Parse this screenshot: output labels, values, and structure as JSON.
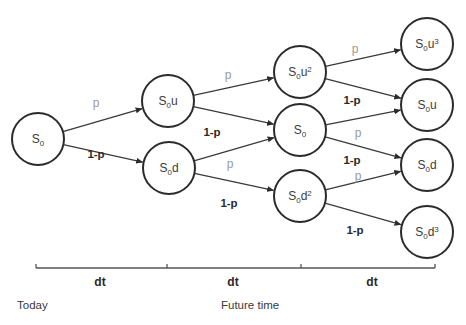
{
  "diagram": {
    "type": "binomial-tree",
    "colors": {
      "node_stroke": "#2b2b2b",
      "edge": "#3a3a3a",
      "up_prob_label": "#9a9a9a",
      "down_prob_label": "#2a2a2a"
    },
    "nodes": [
      {
        "id": "n0",
        "base": "S",
        "sub": "0",
        "suffix": "",
        "sup": "",
        "cx": 38,
        "cy": 139
      },
      {
        "id": "n1u",
        "base": "S",
        "sub": "0",
        "suffix": "u",
        "sup": "",
        "cx": 168,
        "cy": 101
      },
      {
        "id": "n1d",
        "base": "S",
        "sub": "0",
        "suffix": "d",
        "sup": "",
        "cx": 169,
        "cy": 168
      },
      {
        "id": "n2uu",
        "base": "S",
        "sub": "0",
        "suffix": "u",
        "sup": "2",
        "cx": 300,
        "cy": 72
      },
      {
        "id": "n2ud",
        "base": "S",
        "sub": "0",
        "suffix": "",
        "sup": "",
        "cx": 300,
        "cy": 130
      },
      {
        "id": "n2dd",
        "base": "S",
        "sub": "0",
        "suffix": "d",
        "sup": "2",
        "cx": 300,
        "cy": 196
      },
      {
        "id": "n3u3",
        "base": "S",
        "sub": "0",
        "suffix": "u",
        "sup": "3",
        "cx": 427,
        "cy": 44
      },
      {
        "id": "n3u",
        "base": "S",
        "sub": "0",
        "suffix": "u",
        "sup": "",
        "cx": 427,
        "cy": 105
      },
      {
        "id": "n3d",
        "base": "S",
        "sub": "0",
        "suffix": "d",
        "sup": "",
        "cx": 427,
        "cy": 165
      },
      {
        "id": "n3d3",
        "base": "S",
        "sub": "0",
        "suffix": "d",
        "sup": "3",
        "cx": 427,
        "cy": 232
      }
    ],
    "edges": [
      {
        "from": "n0",
        "to": "n1u",
        "label": "p",
        "kind": "up",
        "lx": 96,
        "ly": 107
      },
      {
        "from": "n0",
        "to": "n1d",
        "label": "1-p",
        "kind": "down",
        "lx": 96,
        "ly": 158
      },
      {
        "from": "n1u",
        "to": "n2uu",
        "label": "p",
        "kind": "up",
        "lx": 228,
        "ly": 79
      },
      {
        "from": "n1u",
        "to": "n2ud",
        "label": "1-p",
        "kind": "down",
        "lx": 212,
        "ly": 136
      },
      {
        "from": "n1d",
        "to": "n2ud",
        "label": "p",
        "kind": "up",
        "lx": 230,
        "ly": 168
      },
      {
        "from": "n1d",
        "to": "n2dd",
        "label": "1-p",
        "kind": "down",
        "lx": 229,
        "ly": 207
      },
      {
        "from": "n2uu",
        "to": "n3u3",
        "label": "p",
        "kind": "up",
        "lx": 355,
        "ly": 53
      },
      {
        "from": "n2uu",
        "to": "n3u",
        "label": "1-p",
        "kind": "down",
        "lx": 352,
        "ly": 104
      },
      {
        "from": "n2ud",
        "to": "n3u",
        "label": "p",
        "kind": "up",
        "lx": 358,
        "ly": 137
      },
      {
        "from": "n2ud",
        "to": "n3d",
        "label": "1-p",
        "kind": "down",
        "lx": 352,
        "ly": 164
      },
      {
        "from": "n2dd",
        "to": "n3d",
        "label": "p",
        "kind": "up",
        "lx": 358,
        "ly": 180
      },
      {
        "from": "n2dd",
        "to": "n3d3",
        "label": "1-p",
        "kind": "down",
        "lx": 355,
        "ly": 234
      }
    ],
    "timeline": {
      "y": 268,
      "ticks": [
        36,
        167,
        301,
        435
      ],
      "intervals": [
        {
          "label": "dt",
          "x": 100
        },
        {
          "label": "dt",
          "x": 233
        },
        {
          "label": "dt",
          "x": 372
        }
      ],
      "labels": [
        {
          "id": "today",
          "text": "Today",
          "x": 17,
          "y": 309
        },
        {
          "id": "future",
          "text": "Future time",
          "x": 221,
          "y": 309
        }
      ]
    }
  }
}
